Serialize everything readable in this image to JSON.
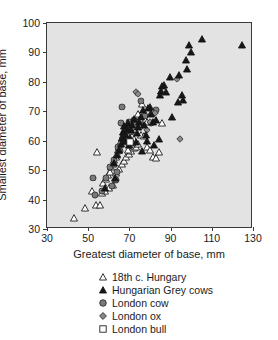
{
  "chart_data": {
    "type": "scatter",
    "title": "",
    "xlabel": "Greatest diameter of base, mm",
    "ylabel": "Smallest diameter of base, mm",
    "xlim": [
      30,
      130
    ],
    "ylim": [
      30,
      100
    ],
    "xticks": [
      30,
      50,
      70,
      90,
      110,
      130
    ],
    "yticks": [
      30,
      40,
      50,
      60,
      70,
      80,
      90,
      100
    ],
    "grid": false,
    "plot_background": "#e3e3e3",
    "legend_position": "below-plot",
    "series": [
      {
        "name": "18th c. Hungary",
        "marker": "open-triangle",
        "color": "#ffffff",
        "edge_color": "#1b1b1b",
        "points": [
          [
            43.0,
            33.8
          ],
          [
            48.5,
            37.2
          ],
          [
            52.0,
            42.8
          ],
          [
            54.0,
            38.2
          ],
          [
            55.5,
            38.2
          ],
          [
            56.5,
            42.2
          ],
          [
            57.0,
            45.5
          ],
          [
            54.5,
            56.0
          ],
          [
            58.5,
            47.0
          ],
          [
            59.5,
            48.5
          ],
          [
            60.5,
            49.5
          ],
          [
            61.0,
            51.0
          ],
          [
            62.0,
            52.0
          ],
          [
            62.5,
            53.5
          ],
          [
            63.5,
            54.5
          ],
          [
            64.0,
            55.5
          ],
          [
            64.5,
            57.0
          ],
          [
            65.0,
            58.0
          ],
          [
            65.5,
            59.0
          ],
          [
            66.0,
            60.0
          ],
          [
            66.5,
            61.0
          ],
          [
            67.0,
            62.0
          ],
          [
            67.5,
            62.5
          ],
          [
            68.0,
            63.5
          ],
          [
            68.5,
            64.5
          ],
          [
            69.0,
            65.5
          ],
          [
            63.5,
            49.0
          ],
          [
            65.0,
            50.5
          ],
          [
            66.5,
            52.0
          ],
          [
            67.5,
            53.0
          ],
          [
            68.5,
            54.5
          ],
          [
            70.0,
            55.5
          ],
          [
            71.0,
            56.5
          ],
          [
            72.0,
            57.5
          ],
          [
            73.0,
            58.0
          ],
          [
            74.0,
            59.0
          ],
          [
            70.5,
            64.0
          ],
          [
            71.5,
            65.0
          ],
          [
            72.5,
            66.0
          ],
          [
            73.5,
            66.5
          ],
          [
            74.5,
            67.0
          ],
          [
            76.0,
            67.5
          ],
          [
            77.5,
            67.0
          ],
          [
            78.5,
            66.5
          ],
          [
            75.5,
            62.0
          ],
          [
            77.0,
            61.5
          ],
          [
            78.5,
            58.0
          ],
          [
            80.0,
            57.0
          ],
          [
            81.5,
            54.5
          ],
          [
            83.0,
            54.0
          ],
          [
            84.5,
            56.2
          ],
          [
            86.0,
            66.0
          ],
          [
            80.5,
            69.5
          ],
          [
            76.0,
            72.5
          ],
          [
            74.0,
            69.0
          ],
          [
            72.0,
            60.5
          ],
          [
            69.5,
            57.0
          ],
          [
            62.0,
            45.0
          ],
          [
            60.0,
            44.0
          ],
          [
            58.0,
            43.0
          ]
        ]
      },
      {
        "name": "Hungarian Grey cows",
        "marker": "filled-triangle",
        "color": "#161616",
        "edge_color": "#161616",
        "points": [
          [
            58.0,
            44.0
          ],
          [
            62.5,
            52.5
          ],
          [
            64.0,
            55.0
          ],
          [
            65.0,
            57.0
          ],
          [
            66.0,
            59.0
          ],
          [
            66.5,
            61.0
          ],
          [
            67.0,
            63.0
          ],
          [
            67.5,
            65.0
          ],
          [
            68.0,
            60.0
          ],
          [
            68.5,
            62.0
          ],
          [
            69.0,
            64.0
          ],
          [
            69.5,
            66.0
          ],
          [
            70.0,
            58.5
          ],
          [
            70.5,
            61.0
          ],
          [
            71.0,
            63.5
          ],
          [
            71.5,
            65.5
          ],
          [
            72.0,
            67.5
          ],
          [
            73.0,
            59.5
          ],
          [
            73.5,
            62.5
          ],
          [
            74.0,
            64.5
          ],
          [
            74.5,
            66.5
          ],
          [
            75.5,
            68.0
          ],
          [
            76.5,
            70.5
          ],
          [
            77.0,
            65.5
          ],
          [
            78.0,
            62.0
          ],
          [
            79.0,
            71.0
          ],
          [
            80.0,
            71.5
          ],
          [
            80.5,
            69.0
          ],
          [
            81.5,
            66.5
          ],
          [
            83.0,
            67.0
          ],
          [
            84.5,
            60.5
          ],
          [
            85.0,
            75.5
          ],
          [
            85.5,
            77.0
          ],
          [
            86.0,
            78.5
          ],
          [
            87.0,
            79.0
          ],
          [
            88.0,
            76.5
          ],
          [
            89.5,
            81.5
          ],
          [
            90.5,
            68.0
          ],
          [
            93.5,
            73.0
          ],
          [
            94.0,
            82.5
          ],
          [
            95.5,
            75.5
          ],
          [
            96.0,
            74.0
          ],
          [
            97.5,
            87.5
          ],
          [
            98.0,
            84.5
          ],
          [
            99.0,
            92.5
          ],
          [
            100.0,
            90.0
          ],
          [
            105.0,
            94.5
          ],
          [
            124.5,
            92.5
          ],
          [
            63.0,
            47.5
          ],
          [
            76.0,
            56.5
          ],
          [
            82.0,
            58.5
          ],
          [
            78.5,
            60.0
          ]
        ]
      },
      {
        "name": "London cow",
        "marker": "filled-circle",
        "color": "#7a7a7a",
        "edge_color": "#2a2a2a",
        "points": [
          [
            52.5,
            47.5
          ],
          [
            53.5,
            41.5
          ],
          [
            56.5,
            43.0
          ],
          [
            58.5,
            47.5
          ],
          [
            60.5,
            51.0
          ],
          [
            62.5,
            53.5
          ],
          [
            63.5,
            46.5
          ],
          [
            64.5,
            58.0
          ],
          [
            65.5,
            56.5
          ],
          [
            66.0,
            66.0
          ],
          [
            66.5,
            71.5
          ],
          [
            67.5,
            62.5
          ],
          [
            68.0,
            59.5
          ],
          [
            69.0,
            64.0
          ],
          [
            70.0,
            66.5
          ],
          [
            71.0,
            63.0
          ],
          [
            72.0,
            67.0
          ],
          [
            73.0,
            65.5
          ],
          [
            75.5,
            73.5
          ],
          [
            77.5,
            68.5
          ],
          [
            80.5,
            66.0
          ],
          [
            83.0,
            70.5
          ],
          [
            64.0,
            49.5
          ],
          [
            61.5,
            44.5
          ]
        ]
      },
      {
        "name": "London ox",
        "marker": "filled-diamond",
        "color": "#8a8a8a",
        "edge_color": "#2a2a2a",
        "points": [
          [
            73.0,
            76.5
          ],
          [
            74.0,
            76.0
          ],
          [
            75.5,
            64.5
          ],
          [
            77.0,
            65.5
          ],
          [
            78.5,
            63.5
          ],
          [
            80.0,
            66.5
          ],
          [
            82.5,
            69.5
          ],
          [
            93.0,
            81.0
          ],
          [
            94.5,
            60.5
          ],
          [
            70.5,
            60.0
          ],
          [
            71.5,
            58.0
          ]
        ]
      },
      {
        "name": "London bull",
        "marker": "open-square",
        "color": "#ffffff",
        "edge_color": "#1b1b1b",
        "points": [
          [
            70.5,
            59.5
          ]
        ]
      }
    ]
  },
  "axes": {
    "y_ticklabels": [
      "100",
      "90",
      "80",
      "70",
      "60",
      "50",
      "40",
      "30"
    ],
    "x_ticklabels": [
      "30",
      "50",
      "70",
      "90",
      "110",
      "130"
    ],
    "y_title": "Smallest diameter of base, mm",
    "x_title": "Greatest diameter of base, mm"
  },
  "legend": {
    "items": [
      {
        "label": "18th c. Hungary",
        "marker": "open-triangle"
      },
      {
        "label": "Hungarian Grey cows",
        "marker": "filled-triangle"
      },
      {
        "label": "London cow",
        "marker": "filled-circle"
      },
      {
        "label": "London ox",
        "marker": "filled-diamond"
      },
      {
        "label": "London bull",
        "marker": "open-square"
      }
    ]
  }
}
